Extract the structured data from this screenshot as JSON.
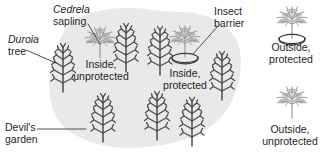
{
  "figure": {
    "background_color": "#ffffff"
  },
  "colors": {
    "garden_blob": "#e9e9e9",
    "garden_blob_edge": "#e0e0e0",
    "duroia_tree": "#4d4d4d",
    "cedrela_sapling": "#9a9a9a",
    "insect_barrier": "#3a3a3a",
    "text": "#231f20",
    "leader_line": "#3a3a3a"
  },
  "labels": {
    "cedrela_sapling": {
      "genus": "Cedrela",
      "common": "sapling"
    },
    "duroia_tree": {
      "genus": "Duroia",
      "common": "tree"
    },
    "devils_garden": {
      "line1": "Devil's",
      "line2": "garden"
    },
    "insect_barrier": {
      "line1": "Insect",
      "line2": "barrier"
    },
    "inside_unprotected": {
      "line1": "Inside,",
      "line2": "unprotected"
    },
    "inside_protected": {
      "line1": "Inside,",
      "line2": "protected"
    },
    "outside_protected": {
      "line1": "Outside,",
      "line2": "protected"
    },
    "outside_unprotected": {
      "line1": "Outside,",
      "line2": "unprotected"
    }
  },
  "treatments": [
    {
      "id": "inside-unprotected",
      "location": "Inside",
      "barrier": "unprotected"
    },
    {
      "id": "inside-protected",
      "location": "Inside",
      "barrier": "protected"
    },
    {
      "id": "outside-protected",
      "location": "Outside",
      "barrier": "protected"
    },
    {
      "id": "outside-unprotected",
      "location": "Outside",
      "barrier": "unprotected"
    }
  ],
  "plants": {
    "duroia_trees": [
      {
        "id": "duroia-1",
        "x": 63,
        "y": 92,
        "height": 46,
        "region": "inside"
      },
      {
        "id": "duroia-2",
        "x": 126,
        "y": 72,
        "height": 62,
        "region": "inside"
      },
      {
        "id": "duroia-3",
        "x": 160,
        "y": 75,
        "height": 60,
        "region": "inside"
      },
      {
        "id": "duroia-4",
        "x": 222,
        "y": 100,
        "height": 56,
        "region": "inside"
      },
      {
        "id": "duroia-5",
        "x": 103,
        "y": 142,
        "height": 52,
        "region": "inside"
      },
      {
        "id": "duroia-6",
        "x": 157,
        "y": 140,
        "height": 52,
        "region": "inside"
      },
      {
        "id": "duroia-7",
        "x": 192,
        "y": 146,
        "height": 52,
        "region": "inside"
      }
    ],
    "cedrela_saplings": [
      {
        "id": "cedrela-inside-unprotected",
        "x": 100,
        "y": 58,
        "protected": false,
        "region": "inside"
      },
      {
        "id": "cedrela-inside-protected",
        "x": 185,
        "y": 62,
        "protected": true,
        "region": "inside"
      },
      {
        "id": "cedrela-outside-protected",
        "x": 292,
        "y": 40,
        "protected": true,
        "region": "outside"
      },
      {
        "id": "cedrela-outside-unprotected",
        "x": 292,
        "y": 118,
        "protected": false,
        "region": "outside"
      }
    ]
  }
}
